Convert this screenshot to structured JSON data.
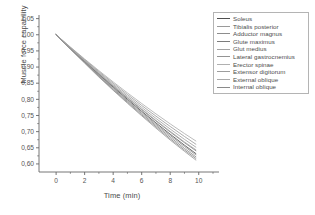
{
  "chart_data": {
    "type": "line",
    "title": "",
    "xlabel": "Time (min)",
    "ylabel": "Muscle force capability",
    "xlim": [
      -1.2,
      11.0
    ],
    "ylim": [
      0.575,
      1.055
    ],
    "xticks": [
      "0",
      "2",
      "4",
      "6",
      "8",
      "10"
    ],
    "xtick_values": [
      0,
      2,
      4,
      6,
      8,
      10
    ],
    "yticks": [
      "0,60",
      "0,65",
      "0,70",
      "0,75",
      "0,80",
      "0,85",
      "0,90",
      "0,95",
      "1,00",
      "1,05"
    ],
    "ytick_values": [
      0.6,
      0.65,
      0.7,
      0.75,
      0.8,
      0.85,
      0.9,
      0.95,
      1.0,
      1.05
    ],
    "grid": false,
    "legend_position": "top-right",
    "x": [
      0,
      1,
      2,
      3,
      4,
      5,
      6,
      7,
      8,
      9,
      9.8
    ],
    "series": [
      {
        "name": "Soleus",
        "color": "#4f4f4f",
        "values": [
          1.0,
          0.958,
          0.917,
          0.877,
          0.838,
          0.8,
          0.763,
          0.727,
          0.692,
          0.658,
          0.632
        ]
      },
      {
        "name": "Tibialis posterior",
        "color": "#9a9a9a",
        "values": [
          1.0,
          0.955,
          0.912,
          0.869,
          0.828,
          0.788,
          0.749,
          0.711,
          0.674,
          0.639,
          0.612
        ]
      },
      {
        "name": "Adductor magnus",
        "color": "#8d8d8d",
        "values": [
          1.0,
          0.957,
          0.915,
          0.873,
          0.833,
          0.794,
          0.756,
          0.719,
          0.683,
          0.648,
          0.622
        ]
      },
      {
        "name": "Glute maximus",
        "color": "#7c7c7c",
        "values": [
          1.0,
          0.959,
          0.919,
          0.879,
          0.841,
          0.804,
          0.768,
          0.733,
          0.699,
          0.666,
          0.641
        ]
      },
      {
        "name": "Glut medius",
        "color": "#a3a3a3",
        "values": [
          1.0,
          0.96,
          0.921,
          0.883,
          0.846,
          0.81,
          0.775,
          0.741,
          0.708,
          0.676,
          0.652
        ]
      },
      {
        "name": "Lateral gastrocnemius",
        "color": "#949494",
        "values": [
          1.0,
          0.958,
          0.916,
          0.875,
          0.836,
          0.797,
          0.76,
          0.723,
          0.688,
          0.654,
          0.628
        ]
      },
      {
        "name": "Erector spinae",
        "color": "#b0b0b0",
        "values": [
          1.0,
          0.962,
          0.925,
          0.889,
          0.854,
          0.82,
          0.787,
          0.755,
          0.724,
          0.694,
          0.671
        ]
      },
      {
        "name": "Extensor digitorum",
        "color": "#9d9d9d",
        "values": [
          1.0,
          0.961,
          0.923,
          0.886,
          0.85,
          0.815,
          0.781,
          0.748,
          0.716,
          0.685,
          0.661
        ]
      },
      {
        "name": "External oblique",
        "color": "#aaaaaa",
        "values": [
          1.0,
          0.959,
          0.92,
          0.881,
          0.843,
          0.806,
          0.77,
          0.735,
          0.701,
          0.668,
          0.644
        ]
      },
      {
        "name": "Internal oblique",
        "color": "#8a8a8a",
        "values": [
          1.0,
          0.956,
          0.914,
          0.871,
          0.83,
          0.791,
          0.752,
          0.715,
          0.678,
          0.643,
          0.617
        ]
      }
    ]
  }
}
